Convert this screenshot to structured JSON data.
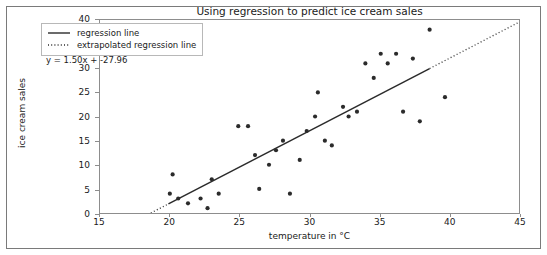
{
  "chart_data": {
    "type": "scatter",
    "title": "Using regression to predict ice cream sales",
    "xlabel": "temperature in °C",
    "ylabel": "ice cream sales",
    "xlim": [
      15,
      45
    ],
    "ylim": [
      0,
      40
    ],
    "xticks": [
      15,
      20,
      25,
      30,
      35,
      40,
      45
    ],
    "yticks": [
      0,
      5,
      10,
      15,
      20,
      25,
      30,
      35,
      40
    ],
    "grid": false,
    "legend_position": "upper left",
    "legend": [
      {
        "label": "regression line",
        "style": "solid",
        "color": "#2b2b2b"
      },
      {
        "label": "extrapolated regression line",
        "style": "dotted",
        "color": "#2b2b2b"
      }
    ],
    "annotations": [
      {
        "text": "y = 1.50x + -27.96",
        "x": 15.9,
        "y": 31.8
      }
    ],
    "regression": {
      "slope": 1.5,
      "intercept": -27.96,
      "equation": "y = 1.50x + -27.96",
      "solid_x_range": [
        19.9,
        38.6
      ],
      "dotted_x_ranges": [
        [
          18.64,
          19.9
        ],
        [
          38.6,
          45.0
        ]
      ],
      "color": "#2b2b2b"
    },
    "points_color": "#2b2b2b",
    "marker": "circle",
    "series": [
      {
        "name": "ice cream sales",
        "x": [
          20.0,
          20.2,
          20.6,
          21.3,
          22.2,
          22.7,
          23.0,
          23.5,
          24.9,
          25.6,
          26.1,
          26.4,
          27.1,
          27.6,
          28.1,
          28.6,
          29.3,
          29.8,
          30.4,
          30.6,
          31.1,
          31.6,
          32.4,
          32.8,
          33.4,
          34.0,
          34.6,
          35.1,
          35.6,
          36.2,
          36.7,
          37.4,
          37.9,
          38.6,
          39.7
        ],
        "y": [
          4.0,
          8.0,
          3.0,
          2.0,
          3.0,
          1.0,
          7.0,
          4.0,
          18.0,
          18.0,
          12.0,
          5.0,
          10.0,
          13.0,
          15.0,
          4.0,
          11.0,
          17.0,
          20.0,
          25.0,
          15.0,
          14.0,
          22.0,
          20.0,
          21.0,
          31.0,
          28.0,
          33.0,
          31.0,
          33.0,
          21.0,
          32.0,
          19.0,
          38.0,
          24.0
        ]
      }
    ]
  }
}
